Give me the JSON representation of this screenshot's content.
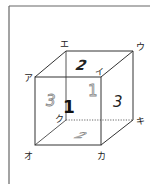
{
  "diagram": {
    "type": "cube-net-perspective",
    "vertex_labels": {
      "a": "ア",
      "i": "イ",
      "u": "ウ",
      "e": "エ",
      "o": "オ",
      "ka": "カ",
      "ki": "キ",
      "ku": "ク"
    },
    "face_numbers": {
      "top": "2",
      "right": "3",
      "front_center": "1",
      "back_ghost": "1",
      "left_ghost": "3",
      "bottom_ghost": "2"
    },
    "colors": {
      "line": "#333333",
      "text": "#222222",
      "ghost": "#8a8a8a",
      "frame": "#555555"
    }
  }
}
